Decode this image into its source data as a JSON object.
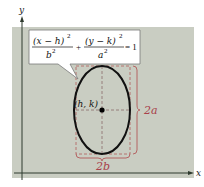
{
  "diagram": {
    "colors": {
      "panel": "#c9cdc2",
      "axis": "#2e3a2e",
      "ellipse": "#111111",
      "guide": "#b25a5a",
      "callout_bg": "#ffffff",
      "callout_border": "#7a7a7a",
      "label": "#111111",
      "dimension_label": "#a8404a"
    },
    "axes": {
      "x_label": "x",
      "y_label": "y"
    },
    "equation": {
      "term1_numerator": "(x − h)",
      "term1_exponent": "2",
      "term1_denominator": "b",
      "term1_denominator_exponent": "2",
      "plus": "+",
      "term2_numerator": "(y − k)",
      "term2_exponent": "2",
      "term2_denominator": "a",
      "term2_denominator_exponent": "2",
      "equals": "= 1"
    },
    "center_label": "(h, k)",
    "major_axis_label": "2a",
    "minor_axis_label": "2b"
  }
}
